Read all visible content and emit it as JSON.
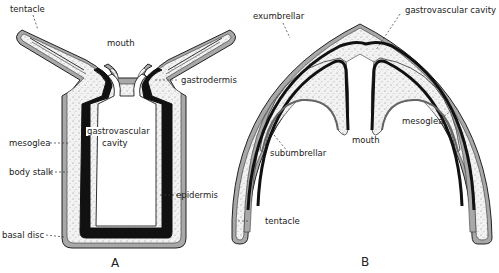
{
  "figure": {
    "type": "biological-diagram",
    "panels": [
      {
        "id": "A",
        "label": "A",
        "labels": {
          "tentacle": "tentacle",
          "mouth": "mouth",
          "gastrodermis": "gastrodermis",
          "cavity_line1": "gastrovascular",
          "cavity_line2": "cavity",
          "mesoglea": "mesoglea",
          "body_stalk": "body stalk",
          "epidermis": "epidermis",
          "basal_disc": "basal disc"
        }
      },
      {
        "id": "B",
        "label": "B",
        "labels": {
          "exumbrellar": "exumbrellar",
          "gastrovascular_cavity": "gastrovascular cavity",
          "subumbrellar": "subumbrellar",
          "mouth": "mouth",
          "mesoglea": "mesoglea",
          "tentacle": "tentacle"
        }
      }
    ],
    "caption": "",
    "colors": {
      "ink": "#1a1a1a",
      "epidermis": "#9a9a9a",
      "mesoglea": "#f0f0f0",
      "gastrodermis": "#111111",
      "background": "#ffffff"
    }
  }
}
